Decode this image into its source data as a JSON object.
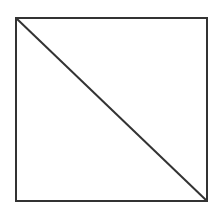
{
  "diagram": {
    "canvas": {
      "width": 216,
      "height": 207,
      "background": "#ffffff"
    },
    "stroke": {
      "color": "#333333",
      "width": 2
    },
    "square": {
      "x": 16,
      "y": 18,
      "width": 191,
      "height": 183
    },
    "diagonal": {
      "x1": 16,
      "y1": 18,
      "x2": 207,
      "y2": 201
    }
  }
}
